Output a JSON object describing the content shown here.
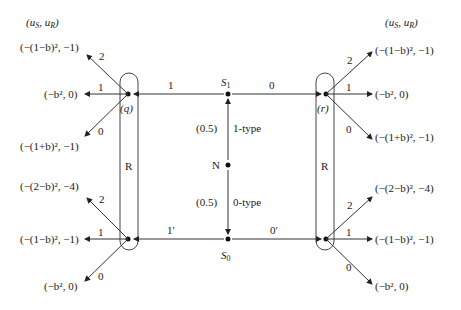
{
  "diagram": {
    "type": "signaling-game-tree",
    "payoff_header": "(uS, uR)",
    "nature": {
      "label": "N",
      "prob_up": "(0.5)",
      "type_up": "1-type",
      "prob_down": "(0.5)",
      "type_down": "0-type"
    },
    "sender_nodes": [
      {
        "id": "S1",
        "label": "S",
        "sub": "1",
        "left_action": "1",
        "right_action": "0"
      },
      {
        "id": "S0",
        "label": "S",
        "sub": "0",
        "left_action": "1′",
        "right_action": "0′"
      }
    ],
    "info_sets": [
      {
        "label": "R",
        "node_label": "(q)"
      },
      {
        "label": "R",
        "node_label": "(r)"
      }
    ],
    "receiver_actions": [
      "2",
      "1",
      "0"
    ],
    "payoffs": {
      "left_top": [
        "(−(1−b)², −1)",
        "(−b², 0)",
        "(−(1+b)², −1)"
      ],
      "left_bottom": [
        "(−(2−b)², −4)",
        "(−(1−b)², −1)",
        "(−b², 0)"
      ],
      "right_top": [
        "(−(1−b)², −1)",
        "(−b², 0)",
        "(−(1+b)², −1)"
      ],
      "right_bottom": [
        "(−(2−b)², −4)",
        "(−(1−b)², −1)",
        "(−b², 0)"
      ]
    }
  }
}
